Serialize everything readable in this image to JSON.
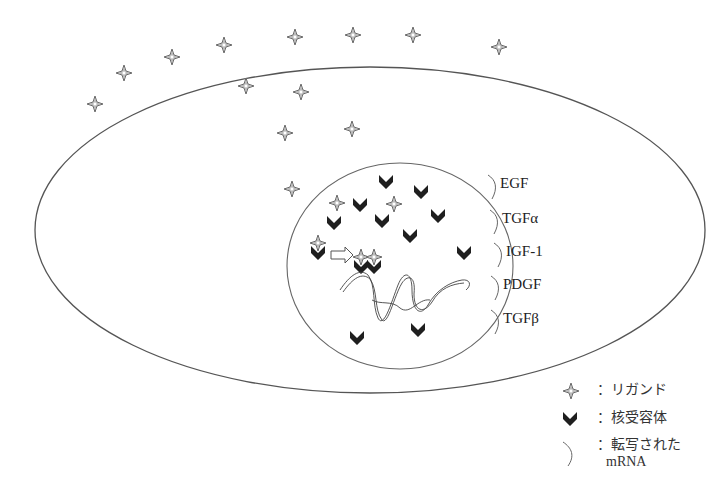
{
  "diagram": {
    "type": "cell-signaling-schematic",
    "cell": {
      "shape": "ellipse",
      "cx": 370,
      "cy": 230,
      "rx": 335,
      "ry": 163,
      "stroke": "#555555"
    },
    "nucleus": {
      "shape": "ellipse",
      "cx": 400,
      "cy": 266,
      "rx": 113,
      "ry": 103,
      "stroke": "#666666"
    },
    "ligand_color": "#9a9a9a",
    "receptor_color": "#1f1f1f",
    "ligands": [
      {
        "x": 95,
        "y": 104
      },
      {
        "x": 124,
        "y": 73
      },
      {
        "x": 172,
        "y": 57
      },
      {
        "x": 224,
        "y": 45
      },
      {
        "x": 295,
        "y": 37
      },
      {
        "x": 353,
        "y": 35
      },
      {
        "x": 413,
        "y": 35
      },
      {
        "x": 499,
        "y": 47
      },
      {
        "x": 246,
        "y": 86
      },
      {
        "x": 301,
        "y": 92
      },
      {
        "x": 285,
        "y": 133
      },
      {
        "x": 352,
        "y": 129
      },
      {
        "x": 292,
        "y": 189
      },
      {
        "x": 337,
        "y": 203
      },
      {
        "x": 394,
        "y": 204
      }
    ],
    "receptors": [
      {
        "x": 386,
        "y": 181
      },
      {
        "x": 421,
        "y": 191
      },
      {
        "x": 360,
        "y": 204
      },
      {
        "x": 334,
        "y": 222
      },
      {
        "x": 382,
        "y": 220
      },
      {
        "x": 438,
        "y": 215
      },
      {
        "x": 410,
        "y": 235
      },
      {
        "x": 464,
        "y": 252
      },
      {
        "x": 357,
        "y": 337
      },
      {
        "x": 418,
        "y": 329
      }
    ],
    "complexes": [
      {
        "x": 318,
        "y": 249,
        "label": "ligand-receptor-complex"
      },
      {
        "x": 361,
        "y": 263,
        "label": "dimer-complex-left"
      },
      {
        "x": 374,
        "y": 263,
        "label": "dimer-complex-right"
      }
    ],
    "arrow": {
      "x1": 331,
      "y1": 255,
      "x2": 352,
      "y2": 255
    },
    "mrna_labels": [
      {
        "text": "EGF",
        "x": 500,
        "y": 183
      },
      {
        "text": "TGFα",
        "x": 502,
        "y": 218
      },
      {
        "text": "IGF-1",
        "x": 506,
        "y": 251
      },
      {
        "text": "PDGF",
        "x": 503,
        "y": 284
      },
      {
        "text": "TGFβ",
        "x": 503,
        "y": 318
      }
    ]
  },
  "legend": {
    "items": [
      {
        "icon": "ligand-star-icon",
        "text": "：リガンド"
      },
      {
        "icon": "receptor-chevron-icon",
        "text": "：核受容体"
      },
      {
        "icon": "mrna-curve-icon",
        "text": "：転写された\nmRNA"
      }
    ],
    "line1": "：リガンド",
    "line2": "：核受容体",
    "line3a": "：転写された",
    "line3b": "mRNA"
  }
}
